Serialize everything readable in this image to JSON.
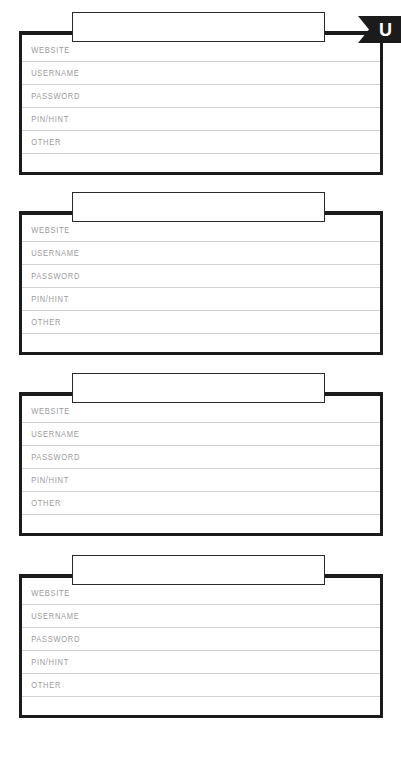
{
  "sheet": {
    "title": "Password Log Sheet",
    "letter_tab": {
      "letter": "U",
      "background_color": "#1b1b1b",
      "text_color": "#ffffff"
    },
    "colors": {
      "card_border": "#1b1b1b",
      "row_rule": "#d2d2d2",
      "label_text": "#9b9b9b",
      "plate_border": "#2a2a2a",
      "page_background": "#ffffff"
    },
    "field_labels": [
      "WEBSITE",
      "USERNAME",
      "PASSWORD",
      "PIN/HINT",
      "OTHER"
    ],
    "entries": [
      {
        "title": "",
        "title_placeholder": "",
        "fields": [
          {
            "label": "WEBSITE",
            "value": ""
          },
          {
            "label": "USERNAME",
            "value": ""
          },
          {
            "label": "PASSWORD",
            "value": ""
          },
          {
            "label": "PIN/HINT",
            "value": ""
          },
          {
            "label": "OTHER",
            "value": ""
          }
        ],
        "has_letter_tab": true
      },
      {
        "title": "",
        "title_placeholder": "",
        "fields": [
          {
            "label": "WEBSITE",
            "value": ""
          },
          {
            "label": "USERNAME",
            "value": ""
          },
          {
            "label": "PASSWORD",
            "value": ""
          },
          {
            "label": "PIN/HINT",
            "value": ""
          },
          {
            "label": "OTHER",
            "value": ""
          }
        ],
        "has_letter_tab": false
      },
      {
        "title": "",
        "title_placeholder": "",
        "fields": [
          {
            "label": "WEBSITE",
            "value": ""
          },
          {
            "label": "USERNAME",
            "value": ""
          },
          {
            "label": "PASSWORD",
            "value": ""
          },
          {
            "label": "PIN/HINT",
            "value": ""
          },
          {
            "label": "OTHER",
            "value": ""
          }
        ],
        "has_letter_tab": false
      },
      {
        "title": "",
        "title_placeholder": "",
        "fields": [
          {
            "label": "WEBSITE",
            "value": ""
          },
          {
            "label": "USERNAME",
            "value": ""
          },
          {
            "label": "PASSWORD",
            "value": ""
          },
          {
            "label": "PIN/HINT",
            "value": ""
          },
          {
            "label": "OTHER",
            "value": ""
          }
        ],
        "has_letter_tab": false
      }
    ]
  }
}
